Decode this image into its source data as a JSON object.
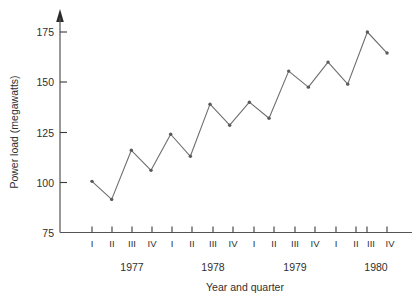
{
  "chart_data": {
    "type": "line",
    "title": "",
    "xlabel": "Year and quarter",
    "ylabel": "Power  load  (megawatts)",
    "x": [
      "1977 I",
      "1977 II",
      "1977 III",
      "1977 IV",
      "1978 I",
      "1978 II",
      "1978 III",
      "1978 IV",
      "1979 I",
      "1979 II",
      "1979 III",
      "1979 IV",
      "1980 I",
      "1980 II",
      "1980 III",
      "1980 IV"
    ],
    "categories": [
      "I",
      "II",
      "III",
      "IV",
      "I",
      "II",
      "III",
      "IV",
      "I",
      "II",
      "III",
      "IV",
      "I",
      "II",
      "III",
      "IV"
    ],
    "values": [
      100.5,
      91.5,
      116,
      106,
      124,
      113,
      139,
      128.5,
      140,
      132,
      155.5,
      147.5,
      160,
      149,
      175,
      164.5
    ],
    "series": [
      {
        "name": "Power load",
        "values": [
          100.5,
          91.5,
          116,
          106,
          124,
          113,
          139,
          128.5,
          140,
          132,
          155.5,
          147.5,
          160,
          149,
          175,
          164.5
        ]
      }
    ],
    "ylim": [
      75,
      180
    ],
    "yticks": [
      75,
      100,
      125,
      150,
      175
    ],
    "ytick_labels": [
      "75",
      "100",
      "125",
      "150",
      "175"
    ],
    "xlim": [
      0,
      17
    ],
    "grid": false,
    "legend": false,
    "markers": true,
    "line_color": "#6e6e6e",
    "marker_color": "#5a5a5a",
    "axis_color": "#555555",
    "background": "#ffffff"
  },
  "axes": {
    "y_label": "Power  load  (megawatts)",
    "x_label": "Year and quarter",
    "y_ticks": [
      {
        "value": 175,
        "label": "175"
      },
      {
        "value": 150,
        "label": "150"
      },
      {
        "value": 125,
        "label": "125"
      },
      {
        "value": 100,
        "label": "100"
      },
      {
        "value": 75,
        "label": "75"
      }
    ],
    "quarters": [
      "I",
      "II",
      "III",
      "IV",
      "I",
      "II",
      "III",
      "IV",
      "I",
      "II",
      "III",
      "IV",
      "I",
      "II",
      "III",
      "IV"
    ],
    "years": [
      {
        "label": "1977"
      },
      {
        "label": "1978"
      },
      {
        "label": "1979"
      },
      {
        "label": "1980"
      }
    ]
  }
}
